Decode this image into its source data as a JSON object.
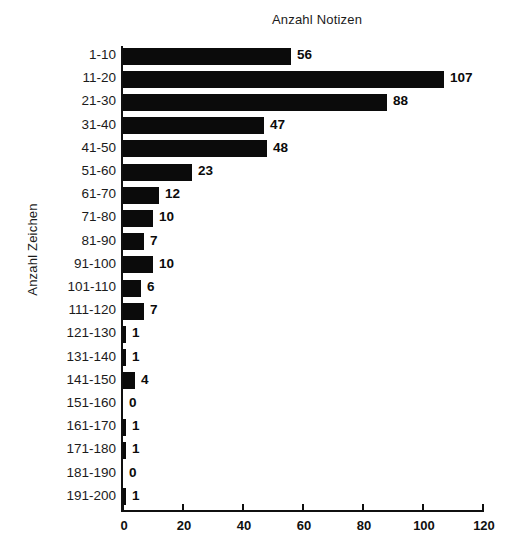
{
  "chart_data": {
    "type": "bar",
    "orientation": "horizontal",
    "title": "Anzahl Notizen",
    "xlabel": "Anzahl Notizen",
    "ylabel": "Anzahl Zeichen",
    "categories": [
      "1-10",
      "11-20",
      "21-30",
      "31-40",
      "41-50",
      "51-60",
      "61-70",
      "71-80",
      "81-90",
      "91-100",
      "101-110",
      "111-120",
      "121-130",
      "131-140",
      "141-150",
      "151-160",
      "161-170",
      "171-180",
      "181-190",
      "191-200"
    ],
    "values": [
      56,
      107,
      88,
      47,
      48,
      23,
      12,
      10,
      7,
      10,
      6,
      7,
      1,
      1,
      4,
      0,
      1,
      1,
      0,
      1
    ],
    "value_labels": [
      "56",
      "107",
      "88",
      "47",
      "48",
      "23",
      "12",
      "10",
      "7",
      "10",
      "6",
      "7",
      "1",
      "1",
      "4",
      "0",
      "1",
      "1",
      "0",
      "1"
    ],
    "xlim": [
      0,
      120
    ],
    "xticks": [
      0,
      20,
      40,
      60,
      80,
      100,
      120
    ],
    "xtick_labels": [
      "0",
      "20",
      "40",
      "60",
      "80",
      "100",
      "120"
    ],
    "grid": false,
    "legend": false,
    "bar_color": "#0b0b0b",
    "background_color": "#ffffff",
    "axis_color": "#101010"
  },
  "axis": {
    "x_title": "Anzahl Notizen",
    "y_title": "Anzahl Zeichen"
  }
}
